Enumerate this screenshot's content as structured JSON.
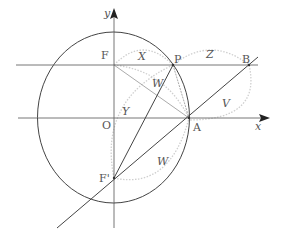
{
  "diagram": {
    "axes": {
      "x_label": "x",
      "y_label": "y",
      "origin_label": "O"
    },
    "points": {
      "F": "F",
      "F_prime": "F'",
      "P": "P",
      "A": "A",
      "B": "B"
    },
    "arc_labels": {
      "X": "X",
      "Y": "Y",
      "Z": "Z",
      "W_upper": "W",
      "W_lower": "W",
      "V": "V"
    },
    "colors": {
      "line": "#444444",
      "light_line": "#9a9a9a",
      "dotted_arc": "#c8c8c8",
      "text": "#555555"
    }
  }
}
